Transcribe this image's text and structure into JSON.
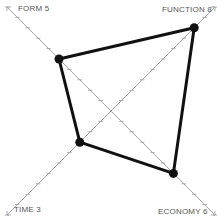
{
  "chart_data": {
    "type": "radar",
    "title": "",
    "axes": [
      {
        "name": "FORM",
        "value": 5,
        "label": "FORM 5",
        "direction": "top-left"
      },
      {
        "name": "FUNCTION",
        "value": 8,
        "label": "FUNCTION 8",
        "direction": "top-right"
      },
      {
        "name": "ECONOMY",
        "value": 6,
        "label": "ECONOMY 6",
        "direction": "bottom-right"
      },
      {
        "name": "TIME",
        "value": 3,
        "label": "TIME 3",
        "direction": "bottom-left"
      }
    ],
    "scale_max": 10,
    "ticks_per_axis": 10,
    "grid": false,
    "legend": "none"
  },
  "labels": {
    "form": "FORM 5",
    "function": "FUNCTION 8",
    "economy": "ECONOMY 6",
    "time": "TIME 3"
  },
  "colors": {
    "axis": "#9a9a9a",
    "polygon": "#111111",
    "label": "#555555"
  }
}
